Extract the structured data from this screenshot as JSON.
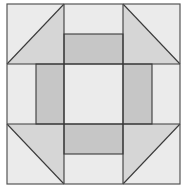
{
  "diagram": {
    "type": "quilt-block",
    "pattern": "churn-dash",
    "grid": "3x3",
    "colors": {
      "background": "#ebebeb",
      "triangle": "#d6d6d6",
      "rectangle": "#c6c6c6",
      "line": "#3a3a3a",
      "outer_border": "#555555"
    },
    "bounds": {
      "x0": 7,
      "y0": 4,
      "x1": 180,
      "y1": 184
    },
    "grid_x": [
      7,
      64,
      123,
      180
    ],
    "grid_y": [
      4,
      64,
      124,
      184
    ],
    "rectangles": [
      {
        "name": "top-rect",
        "x": 64,
        "y": 34,
        "w": 59,
        "h": 30
      },
      {
        "name": "bottom-rect",
        "x": 64,
        "y": 124,
        "w": 59,
        "h": 30
      },
      {
        "name": "left-rect",
        "x": 36,
        "y": 64,
        "w": 28,
        "h": 60
      },
      {
        "name": "right-rect",
        "x": 123,
        "y": 64,
        "w": 29,
        "h": 60
      }
    ],
    "triangles": [
      {
        "name": "top-left-triangle",
        "points": "7,64 64,4 64,64"
      },
      {
        "name": "top-right-triangle",
        "points": "123,4 180,64 123,64"
      },
      {
        "name": "bottom-left-triangle",
        "points": "7,124 64,124 64,184"
      },
      {
        "name": "bottom-right-triangle",
        "points": "123,124 180,124 123,184"
      }
    ]
  }
}
